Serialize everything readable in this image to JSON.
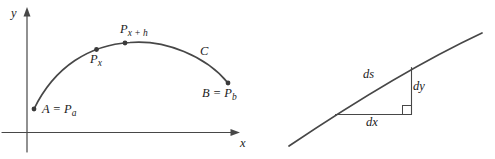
{
  "figure": {
    "left_diagram": {
      "y_axis_label": "y",
      "x_axis_label": "x",
      "curve_label": "C",
      "point_a": {
        "main": "A = P",
        "sub": "a"
      },
      "point_px": {
        "main": "P",
        "sub": "x"
      },
      "point_pxh": {
        "main": "P",
        "sub": "x + h"
      },
      "point_b": {
        "main": "B = P",
        "sub": "b"
      }
    },
    "right_diagram": {
      "hypotenuse_label": "ds",
      "vertical_leg_label": "dy",
      "horizontal_leg_label": "dx"
    },
    "colors": {
      "stroke": "#474747",
      "dot": "#3a3a3a",
      "text": "#1b1b1b",
      "background": "#ffffff"
    }
  }
}
